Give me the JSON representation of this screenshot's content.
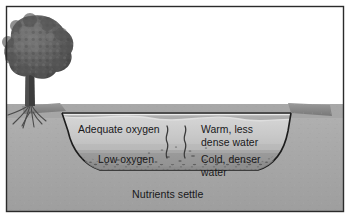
{
  "figure": {
    "name": "lake-thermal-stratification-diagram",
    "style": "grayscale-textbook-illustration",
    "border_color": "#2b2b2b",
    "background_color": "#ffffff"
  },
  "labels": {
    "adequate_oxygen": "Adequate oxygen",
    "low_oxygen": "Low oxygen",
    "warm_line1": "Warm, less",
    "warm_line2": "dense water",
    "cold_line1": "Cold, denser",
    "cold_line2": "water",
    "nutrients_settle": "Nutrients settle"
  },
  "scene": {
    "sky_color": "#ffffff",
    "ground_color": "#a9a9a9",
    "bank_top_color": "#8e8e8e",
    "epilimnion_color": "#c7c7c7",
    "hypolimnion_color": "#9d9d9d",
    "sediment_color": "#8a8a8a",
    "tree_canopy_color": "#5f5f5f",
    "tree_trunk_color": "#3c3c3c",
    "water_surface_line_color": "#2e2e2e",
    "basin_outline_color": "#1c1c1c"
  },
  "elements": {
    "tree": "tree-with-roots",
    "bubbles": "rising-bubble-plumes",
    "sediment": "settling-nutrient-particles",
    "water_surface": "lake-surface-line"
  }
}
